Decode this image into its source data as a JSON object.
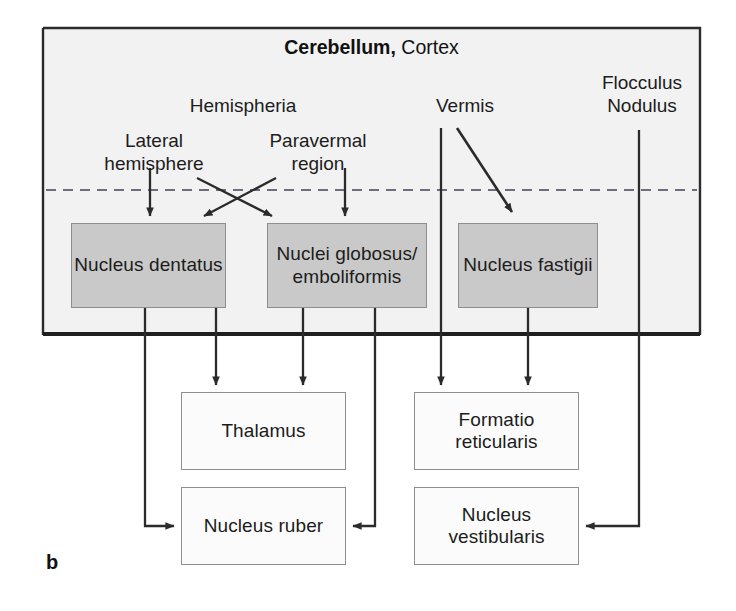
{
  "figure": {
    "letter": "b",
    "width": 736,
    "height": 611
  },
  "panel": {
    "title_bold": "Cerebellum,",
    "title_rest": " Cortex",
    "box": {
      "x": 43,
      "y": 28,
      "w": 657,
      "h": 307
    },
    "divider_y": 190,
    "fill": "#f2f2f2",
    "border_color": "#2b2b2b"
  },
  "colors": {
    "gray_node_fill": "#c9c9c9",
    "white_node_fill": "#fbfbfb",
    "node_border": "#8e8e8e",
    "arrow": "#2b2b2b",
    "dashed_divider": "#6d6d7d",
    "text": "#1c1c1c"
  },
  "cortex_labels": [
    {
      "id": "hemispheria",
      "text": "Hemispheria",
      "x": 158,
      "y": 95,
      "w": 170
    },
    {
      "id": "vermis",
      "text": "Vermis",
      "x": 410,
      "y": 95,
      "w": 110
    },
    {
      "id": "flocculus-nodulus",
      "text": "Flocculus\nNodulus",
      "x": 578,
      "y": 72,
      "w": 128
    },
    {
      "id": "lateral-hemisphere",
      "text": "Lateral\nhemisphere",
      "x": 84,
      "y": 130,
      "w": 140
    },
    {
      "id": "paravermal-region",
      "text": "Paravermal\nregion",
      "x": 248,
      "y": 130,
      "w": 140
    }
  ],
  "nuclei": [
    {
      "id": "nucleus-dentatus",
      "text": "Nucleus\ndentatus",
      "x": 71,
      "y": 223,
      "w": 155,
      "h": 85,
      "style": "gray"
    },
    {
      "id": "nuclei-globosus-emboliformis",
      "text": "Nuclei\nglobosus/\nemboliformis",
      "x": 267,
      "y": 223,
      "w": 160,
      "h": 85,
      "style": "gray"
    },
    {
      "id": "nucleus-fastigii",
      "text": "Nucleus\nfastigii",
      "x": 458,
      "y": 223,
      "w": 140,
      "h": 85,
      "style": "gray"
    }
  ],
  "targets": [
    {
      "id": "thalamus",
      "text": "Thalamus",
      "x": 181,
      "y": 392,
      "w": 165,
      "h": 78,
      "style": "white"
    },
    {
      "id": "formatio-reticularis",
      "text": "Formatio\nreticularis",
      "x": 414,
      "y": 392,
      "w": 165,
      "h": 78,
      "style": "white"
    },
    {
      "id": "nucleus-ruber",
      "text": "Nucleus\nruber",
      "x": 181,
      "y": 487,
      "w": 165,
      "h": 78,
      "style": "white"
    },
    {
      "id": "nucleus-vestibularis",
      "text": "Nucleus\nvestibularis",
      "x": 414,
      "y": 487,
      "w": 165,
      "h": 78,
      "style": "white"
    }
  ],
  "connections": [
    {
      "id": "lateral-to-dentatus",
      "from": "lateral-hemisphere",
      "to": "nucleus-dentatus",
      "type": "straight-down-arrow"
    },
    {
      "id": "lateral-to-globosus",
      "from": "lateral-hemisphere",
      "to": "nuclei-globosus-emboliformis",
      "type": "diagonal-cross-arrow"
    },
    {
      "id": "paravermal-to-dentatus",
      "from": "paravermal-region",
      "to": "nucleus-dentatus",
      "type": "diagonal-cross-arrow"
    },
    {
      "id": "paravermal-to-globosus",
      "from": "paravermal-region",
      "to": "nuclei-globosus-emboliformis",
      "type": "straight-down-arrow"
    },
    {
      "id": "vermis-to-fastigii",
      "from": "vermis",
      "to": "nucleus-fastigii",
      "type": "diagonal-arrow"
    },
    {
      "id": "vermis-to-formatio",
      "from": "vermis",
      "to": "formatio-reticularis",
      "type": "straight-down-arrow"
    },
    {
      "id": "flocculus-to-vestibularis",
      "from": "flocculus-nodulus",
      "to": "nucleus-vestibularis",
      "type": "elbow-arrow"
    },
    {
      "id": "dentatus-to-thalamus",
      "from": "nucleus-dentatus",
      "to": "thalamus",
      "type": "straight-down-arrow"
    },
    {
      "id": "dentatus-to-ruber",
      "from": "nucleus-dentatus",
      "to": "nucleus-ruber",
      "type": "elbow-arrow"
    },
    {
      "id": "globosus-to-thalamus",
      "from": "nuclei-globosus-emboliformis",
      "to": "thalamus",
      "type": "straight-down-arrow"
    },
    {
      "id": "globosus-to-ruber",
      "from": "nuclei-globosus-emboliformis",
      "to": "nucleus-ruber",
      "type": "elbow-arrow"
    },
    {
      "id": "fastigii-to-formatio",
      "from": "nucleus-fastigii",
      "to": "formatio-reticularis",
      "type": "straight-down-arrow"
    }
  ]
}
